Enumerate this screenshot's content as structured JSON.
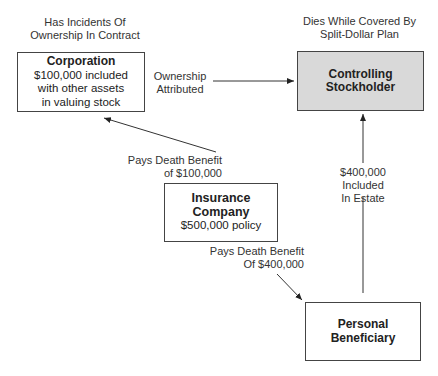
{
  "labels": {
    "corp_above": [
      "Has Incidents Of",
      "Ownership In Contract"
    ],
    "stock_above": [
      "Dies While Covered By",
      "Split-Dollar Plan"
    ],
    "ownership": [
      "Ownership",
      "Attributed"
    ],
    "pays_corp": [
      "Pays Death Benefit",
      "of $100,000"
    ],
    "pays_benef": [
      "Pays Death Benefit",
      "Of $400,000"
    ],
    "estate": [
      "$400,000",
      "Included",
      "In Estate"
    ]
  },
  "nodes": {
    "corporation": {
      "title": "Corporation",
      "lines": [
        "$100,000 included",
        "with other assets",
        "in valuing stock"
      ]
    },
    "stockholder": {
      "title": [
        "Controlling",
        "Stockholder"
      ],
      "fill": "#d9d9d9"
    },
    "insurance": {
      "title": "Insurance Company",
      "sub": "$500,000 policy"
    },
    "beneficiary": {
      "title": [
        "Personal",
        "Beneficiary"
      ]
    }
  }
}
